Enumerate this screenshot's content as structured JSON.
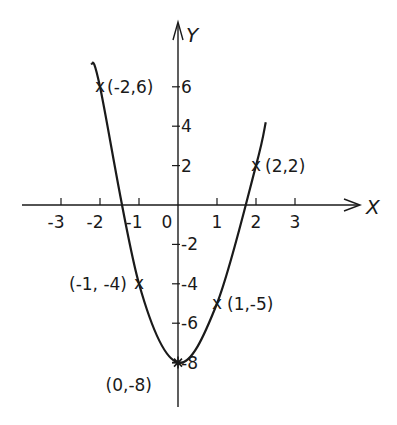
{
  "chart_data": {
    "type": "line",
    "title": "",
    "xlabel": "X",
    "ylabel": "Y",
    "xlim": [
      -4,
      4.5
    ],
    "ylim": [
      -10,
      7.5
    ],
    "grid": false,
    "x_ticks": [
      -3,
      -2,
      -1,
      0,
      1,
      2,
      3
    ],
    "x_tick_labels": [
      "-3",
      "-2",
      "-1",
      "0",
      "1",
      "2",
      "3"
    ],
    "y_ticks": [
      6,
      4,
      2,
      -2,
      -4,
      -6,
      -8
    ],
    "y_tick_labels": [
      "6",
      "4",
      "2",
      "-2",
      "-4",
      "-6",
      "-8"
    ],
    "series": [
      {
        "name": "curve",
        "x": [
          -2,
          -1,
          0,
          1,
          2
        ],
        "y": [
          6,
          -4,
          -8,
          -5,
          2
        ]
      }
    ],
    "annotations": [
      {
        "x": -2,
        "y": 6,
        "text": "(-2,6)",
        "marker": "x"
      },
      {
        "x": -1,
        "y": -4,
        "text": "(-1, -4)",
        "marker": "x"
      },
      {
        "x": 0,
        "y": -8,
        "text": "(0,-8)",
        "marker": "star"
      },
      {
        "x": 1,
        "y": -5,
        "text": "(1,-5)",
        "marker": "x"
      },
      {
        "x": 2,
        "y": 2,
        "text": "(2,2)",
        "marker": "x"
      }
    ],
    "colors": {
      "line": "#1a1a1a",
      "background": "#ffffff"
    }
  }
}
